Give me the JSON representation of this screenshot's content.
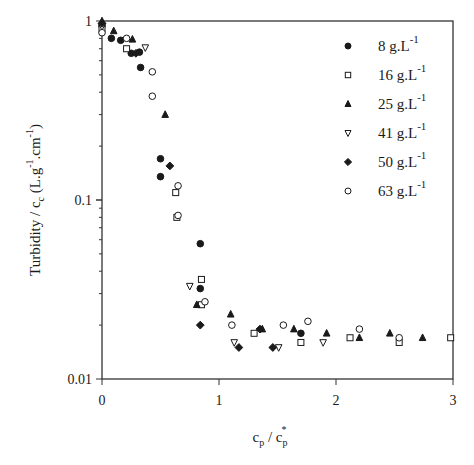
{
  "chart_data": {
    "type": "scatter",
    "title": "",
    "xlabel": "c_p / c_p*",
    "ylabel": "Turbidity / c_c (L.g-1.cm-1)",
    "xlim": [
      0,
      3
    ],
    "ylim": [
      0.01,
      1
    ],
    "yscale": "log",
    "x_ticks": [
      "0",
      "1",
      "2",
      "3"
    ],
    "y_ticks": [
      "0.01",
      "0.1",
      "1"
    ],
    "grid": false,
    "legend_position": "upper right (inside)",
    "series": [
      {
        "name": "8 g.L-1",
        "marker": "filled-circle",
        "points": [
          [
            0,
            0.94
          ],
          [
            0.08,
            0.8
          ],
          [
            0.16,
            0.78
          ],
          [
            0.25,
            0.66
          ],
          [
            0.32,
            0.67
          ],
          [
            0.33,
            0.55
          ],
          [
            0.5,
            0.17
          ],
          [
            0.5,
            0.135
          ],
          [
            0.84,
            0.057
          ],
          [
            0.84,
            0.032
          ],
          [
            1.7,
            0.018
          ]
        ]
      },
      {
        "name": "16 g.L-1",
        "marker": "open-square",
        "points": [
          [
            0,
            0.9
          ],
          [
            0.21,
            0.7
          ],
          [
            0.63,
            0.11
          ],
          [
            0.64,
            0.08
          ],
          [
            0.85,
            0.036
          ],
          [
            0.85,
            0.026
          ],
          [
            1.3,
            0.018
          ],
          [
            1.7,
            0.016
          ],
          [
            2.12,
            0.017
          ],
          [
            2.54,
            0.016
          ],
          [
            2.98,
            0.017
          ]
        ]
      },
      {
        "name": "25 g.L-1",
        "marker": "filled-triangle-up",
        "points": [
          [
            0,
            1.0
          ],
          [
            0.1,
            0.88
          ],
          [
            0.26,
            0.79
          ],
          [
            0.54,
            0.3
          ],
          [
            0.81,
            0.026
          ],
          [
            1.1,
            0.023
          ],
          [
            1.37,
            0.019
          ],
          [
            1.64,
            0.019
          ],
          [
            1.92,
            0.018
          ],
          [
            2.2,
            0.017
          ],
          [
            2.46,
            0.018
          ],
          [
            2.74,
            0.017
          ]
        ]
      },
      {
        "name": "41 g.L-1",
        "marker": "open-triangle-down",
        "points": [
          [
            0,
            0.93
          ],
          [
            0.37,
            0.71
          ],
          [
            0.75,
            0.033
          ],
          [
            1.13,
            0.016
          ],
          [
            1.51,
            0.015
          ],
          [
            1.89,
            0.016
          ]
        ]
      },
      {
        "name": "50 g.L-1",
        "marker": "filled-diamond",
        "points": [
          [
            0,
            0.97
          ],
          [
            0.29,
            0.66
          ],
          [
            0.58,
            0.155
          ],
          [
            0.84,
            0.02
          ],
          [
            1.17,
            0.015
          ],
          [
            1.35,
            0.019
          ],
          [
            1.46,
            0.015
          ]
        ]
      },
      {
        "name": "63 g.L-1",
        "marker": "open-circle",
        "points": [
          [
            0,
            0.86
          ],
          [
            0.21,
            0.8
          ],
          [
            0.43,
            0.52
          ],
          [
            0.43,
            0.38
          ],
          [
            0.65,
            0.12
          ],
          [
            0.65,
            0.082
          ],
          [
            0.88,
            0.027
          ],
          [
            1.11,
            0.02
          ],
          [
            1.55,
            0.02
          ],
          [
            1.76,
            0.021
          ],
          [
            2.2,
            0.019
          ],
          [
            2.54,
            0.017
          ]
        ]
      }
    ]
  },
  "axes": {
    "x_title_main": "c",
    "x_title_sub": "p",
    "x_title_sep": " / c",
    "x_title_sub2": "p",
    "x_title_sup": "*",
    "y_title": "Turbidity / c",
    "y_title_sub": "c",
    "y_title_rest": " (L.g",
    "y_title_sup1": "-1",
    "y_title_mid": ".cm",
    "y_title_sup2": "-1",
    "y_title_end": ")"
  },
  "legend": {
    "items": [
      {
        "value": "8 g.L",
        "sup": "-1"
      },
      {
        "value": "16 g.L",
        "sup": "-1"
      },
      {
        "value": "25 g.L",
        "sup": "-1"
      },
      {
        "value": "41 g.L",
        "sup": "-1"
      },
      {
        "value": "50 g.L",
        "sup": "-1"
      },
      {
        "value": "63 g.L",
        "sup": "-1"
      }
    ]
  },
  "colors": {
    "ink": "#1a1a1a",
    "background": "#ffffff"
  }
}
